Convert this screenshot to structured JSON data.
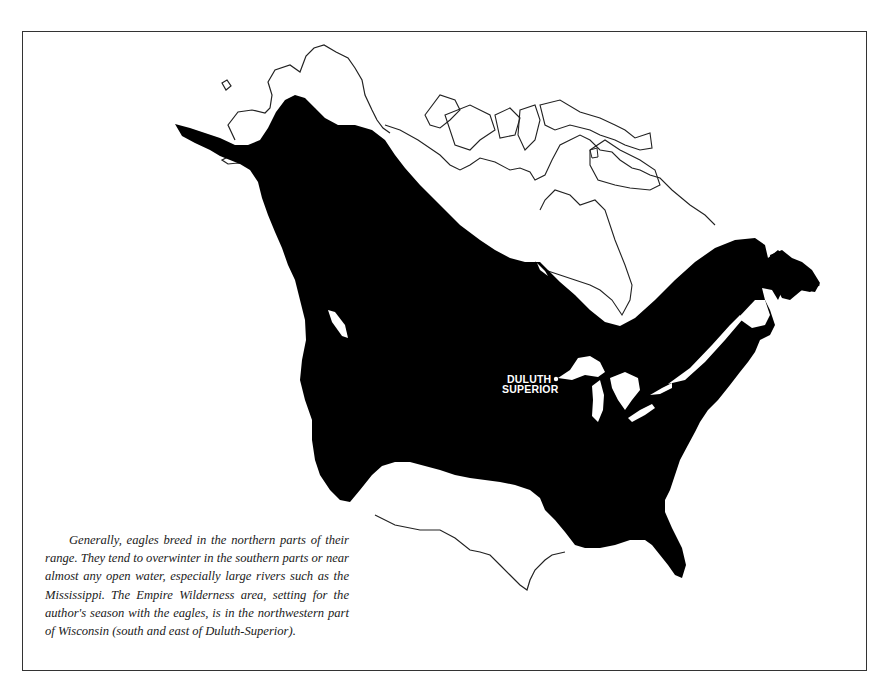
{
  "map": {
    "title": "Bald eagle range in North America",
    "colors": {
      "range_fill": "#000000",
      "background": "#ffffff",
      "outline": "#222222",
      "frame": "#333333"
    },
    "labels": {
      "city_line1": "DULUTH",
      "city_line2": "SUPERIOR"
    },
    "legend_marker": "city-dot"
  },
  "caption": {
    "text": "Generally, eagles breed in the northern parts of their range. They tend to overwinter in the southern parts or near almost any open water, especially large rivers such as the Mississippi. The Empire Wilderness area, setting for the author's season with the eagles, is in the northwestern part of Wisconsin (south and east of Duluth-Superior)."
  }
}
